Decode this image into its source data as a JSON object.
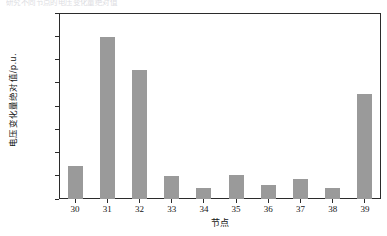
{
  "figure": {
    "clipped_text_above": "研究不同节点的电压变化量绝对值",
    "background_color": "#ffffff",
    "frame_color": "#2b2b2b",
    "bar_color": "#9a9a9a"
  },
  "chart_data": {
    "type": "bar",
    "title": "",
    "subtitle": "",
    "xlabel": "节点",
    "ylabel": "电压变化量绝对值/p.u.",
    "categories": [
      "30",
      "31",
      "32",
      "33",
      "34",
      "35",
      "36",
      "37",
      "38",
      "39"
    ],
    "values": [
      0.0142,
      0.0698,
      0.0557,
      0.0101,
      0.0046,
      0.0105,
      0.0059,
      0.0088,
      0.0046,
      0.0451
    ],
    "series": [
      {
        "name": "电压变化量绝对值",
        "values": [
          0.0142,
          0.0698,
          0.0557,
          0.0101,
          0.0046,
          0.0105,
          0.0059,
          0.0088,
          0.0046,
          0.0451
        ]
      }
    ],
    "ylim": [
      0.0,
      0.08
    ],
    "ytick_step": 0.01,
    "ytick_labels": [
      "0.0000",
      "0.0100",
      "0.0200",
      "0.0300",
      "0.0400",
      "0.0500",
      "0.0600",
      "0.0700",
      "0.0800"
    ],
    "ytick_values": [
      0.0,
      0.01,
      0.02,
      0.03,
      0.04,
      0.05,
      0.06,
      0.07,
      0.08
    ],
    "xtick_labels": [
      "30",
      "31",
      "32",
      "33",
      "34",
      "35",
      "36",
      "37",
      "38",
      "39"
    ],
    "grid": false,
    "legend": null,
    "legend_position": "none",
    "annotations": []
  }
}
